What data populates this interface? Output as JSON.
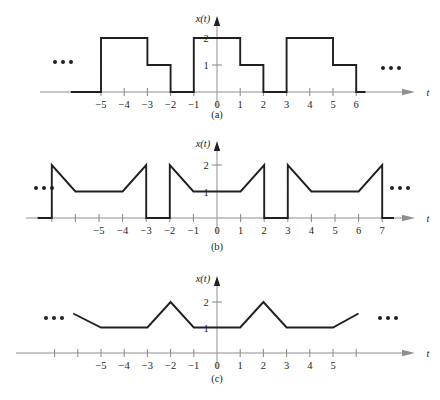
{
  "figure": {
    "title": "",
    "background": "#ffffff",
    "wave_color": "#231f20",
    "axis_color": "#8f8f8f"
  },
  "panels": [
    {
      "id": "a",
      "caption": "(a)",
      "y_axis_label": "x(t)",
      "x_axis_label": "t",
      "x_ticks": [
        -5,
        -4,
        -3,
        -2,
        -1,
        0,
        1,
        2,
        3,
        4,
        5,
        6
      ],
      "x_tick_labels": [
        "−5",
        "−4",
        "−3",
        "−2",
        "−1",
        "0",
        "1",
        "2",
        "3",
        "4",
        "5",
        "6"
      ],
      "y_ticks": [
        1,
        2
      ],
      "y_tick_labels": [
        "1",
        "2"
      ],
      "ellipsis_left": "•••",
      "ellipsis_right": "•••"
    },
    {
      "id": "b",
      "caption": "(b)",
      "y_axis_label": "x(t)",
      "x_axis_label": "t",
      "x_ticks": [
        -7,
        -6,
        -5,
        -4,
        -3,
        -2,
        -1,
        0,
        1,
        2,
        3,
        4,
        5,
        6,
        7
      ],
      "x_tick_labels": [
        "",
        "",
        "−5",
        "−4",
        "−3",
        "−2",
        "−1",
        "0",
        "1",
        "2",
        "3",
        "4",
        "5",
        "6",
        "7"
      ],
      "y_ticks": [
        1,
        2
      ],
      "y_tick_labels": [
        "1",
        "2"
      ],
      "ellipsis_left": "•••",
      "ellipsis_right": "•••"
    },
    {
      "id": "c",
      "caption": "(c)",
      "y_axis_label": "x(t)",
      "x_axis_label": "t",
      "x_ticks": [
        -7,
        -6,
        -5,
        -4,
        -3,
        -2,
        -1,
        0,
        1,
        2,
        3,
        4,
        5,
        6
      ],
      "x_tick_labels": [
        "",
        "",
        "−5",
        "−4",
        "−3",
        "−2",
        "−1",
        "0",
        "1",
        "2",
        "3",
        "4",
        "5",
        ""
      ],
      "y_ticks": [
        1,
        2
      ],
      "y_tick_labels": [
        "1",
        "2"
      ],
      "ellipsis_left": "•••",
      "ellipsis_right": "•••"
    }
  ],
  "chart_data": [
    {
      "type": "line",
      "panel": "a",
      "title": "",
      "xlabel": "t",
      "ylabel": "x(t)",
      "xlim": [
        -6.3,
        7.2
      ],
      "ylim": [
        0,
        2.4
      ],
      "grid": false,
      "legend": "none",
      "description": "Periodic rectangular pulse train, period 4: value 2 on [4k-1, 4k+1], value 1 on [4k+1, 4k+2], value 0 on [4k+2, 4k+3].",
      "period": 4,
      "points": [
        [
          -6.3,
          0
        ],
        [
          -5,
          0
        ],
        [
          -5,
          2
        ],
        [
          -3,
          2
        ],
        [
          -3,
          1
        ],
        [
          -2,
          1
        ],
        [
          -2,
          0
        ],
        [
          -1,
          0
        ],
        [
          -1,
          2
        ],
        [
          1,
          2
        ],
        [
          1,
          1
        ],
        [
          2,
          1
        ],
        [
          2,
          0
        ],
        [
          3,
          0
        ],
        [
          3,
          2
        ],
        [
          5,
          2
        ],
        [
          5,
          1
        ],
        [
          6,
          1
        ],
        [
          6,
          0
        ],
        [
          6.4,
          0
        ]
      ]
    },
    {
      "type": "line",
      "panel": "b",
      "title": "",
      "xlabel": "t",
      "ylabel": "x(t)",
      "xlim": [
        -7.6,
        8.0
      ],
      "ylim": [
        0,
        2.4
      ],
      "grid": false,
      "legend": "none",
      "description": "Periodic sawtooth-and-flat train, period 5: jumps to 2 at t=5k-2, decays linearly to 1 at t=5k-1, flat at 1 to t=5k+1, ramps up to 2 at t=5k+2, drops to 0, zero until next period.",
      "period": 5,
      "points": [
        [
          -7.6,
          0
        ],
        [
          -7,
          0
        ],
        [
          -7,
          2
        ],
        [
          -6,
          1
        ],
        [
          -4,
          1
        ],
        [
          -3,
          2
        ],
        [
          -3,
          0
        ],
        [
          -2,
          0
        ],
        [
          -2,
          2
        ],
        [
          -1,
          1
        ],
        [
          1,
          1
        ],
        [
          2,
          2
        ],
        [
          2,
          0
        ],
        [
          3,
          0
        ],
        [
          3,
          2
        ],
        [
          4,
          1
        ],
        [
          6,
          1
        ],
        [
          7,
          2
        ],
        [
          7,
          0
        ],
        [
          7.5,
          0
        ]
      ]
    },
    {
      "type": "line",
      "panel": "c",
      "title": "",
      "xlabel": "t",
      "ylabel": "x(t)",
      "xlim": [
        -7.4,
        7.4
      ],
      "ylim": [
        0,
        2.4
      ],
      "grid": false,
      "legend": "none",
      "description": "Periodic triangular train on a pedestal, period 4: flat at 1 on [4k+1, 4k+3], rising to peak 2 at t=4k+2 (shifted), no zero crossings.",
      "period": 4,
      "points": [
        [
          -6.2,
          1.55
        ],
        [
          -5,
          1
        ],
        [
          -3,
          1
        ],
        [
          -2,
          2
        ],
        [
          -1,
          1
        ],
        [
          1,
          1
        ],
        [
          2,
          2
        ],
        [
          3,
          1
        ],
        [
          5,
          1
        ],
        [
          6.1,
          1.55
        ]
      ]
    }
  ]
}
